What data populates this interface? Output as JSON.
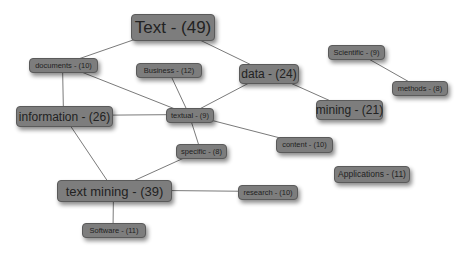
{
  "diagram": {
    "type": "keyword-network",
    "nodes": [
      {
        "id": "text",
        "label": "Text - (49)",
        "x": 131,
        "y": 14,
        "w": 82,
        "h": 25,
        "fs": 17
      },
      {
        "id": "documents",
        "label": "documents - (10)",
        "x": 29,
        "y": 58,
        "w": 67,
        "h": 13,
        "fs": 7.5
      },
      {
        "id": "business",
        "label": "Business - (12)",
        "x": 136,
        "y": 63,
        "w": 64,
        "h": 13,
        "fs": 7.5
      },
      {
        "id": "data",
        "label": "data - (24)",
        "x": 239,
        "y": 64,
        "w": 58,
        "h": 18,
        "fs": 12
      },
      {
        "id": "scientific",
        "label": "Scientific - (9)",
        "x": 328,
        "y": 45,
        "w": 55,
        "h": 13,
        "fs": 7.5
      },
      {
        "id": "methods",
        "label": "methods - (8)",
        "x": 392,
        "y": 81,
        "w": 54,
        "h": 13,
        "fs": 7.5
      },
      {
        "id": "information",
        "label": "information - (26)",
        "x": 16,
        "y": 106,
        "w": 95,
        "h": 19,
        "fs": 12
      },
      {
        "id": "textual",
        "label": "textual - (9)",
        "x": 166,
        "y": 108,
        "w": 46,
        "h": 13,
        "fs": 7.5
      },
      {
        "id": "mining",
        "label": "mining - (21)",
        "x": 316,
        "y": 100,
        "w": 65,
        "h": 18,
        "fs": 12
      },
      {
        "id": "content",
        "label": "content - (10)",
        "x": 276,
        "y": 137,
        "w": 55,
        "h": 14,
        "fs": 7.5
      },
      {
        "id": "specific",
        "label": "specific - (8)",
        "x": 176,
        "y": 144,
        "w": 49,
        "h": 13,
        "fs": 7.5
      },
      {
        "id": "applications",
        "label": "Applications - (11)",
        "x": 334,
        "y": 166,
        "w": 74,
        "h": 15,
        "fs": 8.5
      },
      {
        "id": "text_mining",
        "label": "text mining - (39)",
        "x": 57,
        "y": 180,
        "w": 113,
        "h": 20,
        "fs": 13
      },
      {
        "id": "research",
        "label": "research - (10)",
        "x": 238,
        "y": 185,
        "w": 58,
        "h": 13,
        "fs": 7.5
      },
      {
        "id": "software",
        "label": "Software - (11)",
        "x": 82,
        "y": 223,
        "w": 62,
        "h": 13,
        "fs": 7.5
      }
    ],
    "edges": [
      [
        "text",
        "documents"
      ],
      [
        "text",
        "data"
      ],
      [
        "documents",
        "information"
      ],
      [
        "documents",
        "textual"
      ],
      [
        "business",
        "textual"
      ],
      [
        "information",
        "textual"
      ],
      [
        "information",
        "text_mining"
      ],
      [
        "data",
        "textual"
      ],
      [
        "data",
        "mining"
      ],
      [
        "scientific",
        "methods"
      ],
      [
        "textual",
        "specific"
      ],
      [
        "textual",
        "content"
      ],
      [
        "specific",
        "text_mining"
      ],
      [
        "text_mining",
        "research"
      ],
      [
        "text_mining",
        "software"
      ]
    ],
    "colors": {
      "node_fill": "#7d7d7d",
      "node_border": "#5a5a5a",
      "edge": "#7a7a7a",
      "text": "#222222"
    }
  }
}
